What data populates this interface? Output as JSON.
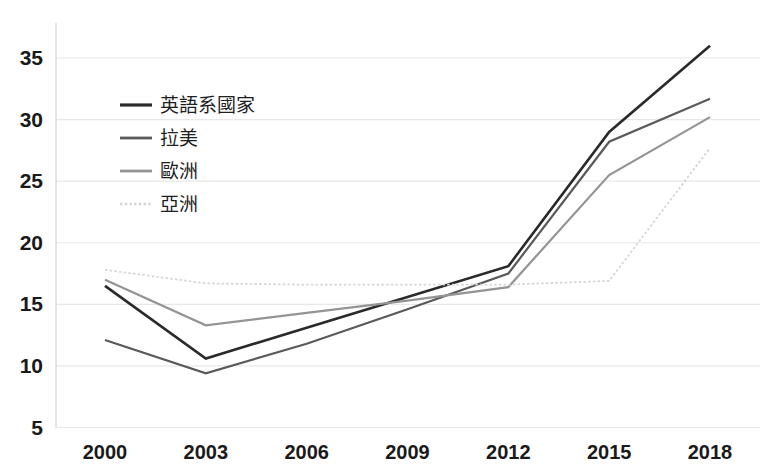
{
  "chart_data": {
    "type": "line",
    "title": "",
    "subtitle": "",
    "xlabel": "",
    "ylabel": "",
    "categories": [
      "2000",
      "2003",
      "2006",
      "2009",
      "2012",
      "2015",
      "2018"
    ],
    "x": [
      2000,
      2003,
      2006,
      2009,
      2012,
      2015,
      2018
    ],
    "xlim": [
      2000,
      2018
    ],
    "ylim": [
      5,
      37
    ],
    "yticks": [
      5,
      10,
      15,
      20,
      25,
      30,
      35
    ],
    "ytick_labels": [
      "5",
      "10",
      "15",
      "20",
      "25",
      "30",
      "35"
    ],
    "xtick_labels": [
      "2000",
      "2003",
      "2006",
      "2009",
      "2012",
      "2015",
      "2018"
    ],
    "grid": true,
    "grid_axis": "y",
    "legend_position": "upper-left-inside",
    "series": [
      {
        "name": "英語系國家",
        "color": "#2a2a2a",
        "width": 2.6,
        "style": "solid",
        "values": [
          16.5,
          10.6,
          13.1,
          15.6,
          18.1,
          29.0,
          36.0
        ]
      },
      {
        "name": "拉美",
        "color": "#5a5a5a",
        "width": 2.2,
        "style": "solid",
        "values": [
          12.1,
          9.4,
          11.8,
          14.6,
          17.5,
          28.2,
          31.7
        ]
      },
      {
        "name": "歐洲",
        "color": "#949494",
        "width": 2.2,
        "style": "solid",
        "values": [
          17.0,
          13.3,
          14.3,
          15.3,
          16.4,
          25.5,
          30.2
        ]
      },
      {
        "name": "亞洲",
        "color": "#d6d6d6",
        "width": 1.8,
        "style": "dotted",
        "values": [
          17.8,
          16.7,
          16.6,
          16.6,
          16.6,
          16.9,
          27.7
        ]
      }
    ]
  },
  "legend": {
    "entries": [
      {
        "label": "英語系國家"
      },
      {
        "label": "拉美"
      },
      {
        "label": "歐洲"
      },
      {
        "label": "亞洲"
      }
    ]
  }
}
